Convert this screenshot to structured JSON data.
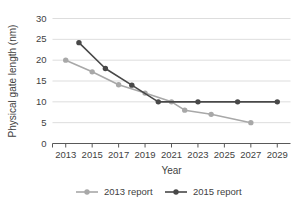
{
  "chart_data": {
    "type": "line",
    "title": "",
    "xlabel": "Year",
    "ylabel": "Physical gate length (nm)",
    "xlim": [
      2012,
      2030
    ],
    "ylim": [
      0,
      30
    ],
    "yticks": [
      0,
      5,
      10,
      15,
      20,
      25,
      30
    ],
    "ytick_labels": [
      "0",
      "5",
      "10",
      "15",
      "20",
      "25",
      "30"
    ],
    "xticks": [
      2013,
      2015,
      2017,
      2019,
      2021,
      2023,
      2025,
      2027,
      2029
    ],
    "xtick_labels": [
      "2013",
      "2015",
      "2017",
      "2019",
      "2021",
      "2023",
      "2025",
      "2027",
      "2029"
    ],
    "grid": "horizontal",
    "legend_position": "bottom",
    "series": [
      {
        "name": "2013 report",
        "color": "#a8a8a8",
        "marker": "circle",
        "x": [
          2013,
          2015,
          2017,
          2019,
          2021,
          2022,
          2024,
          2027
        ],
        "values": [
          20.0,
          17.2,
          14.1,
          12.1,
          10.0,
          8.0,
          7.0,
          5.0
        ]
      },
      {
        "name": "2015 report",
        "color": "#484848",
        "marker": "circle",
        "x": [
          2014,
          2016,
          2018,
          2020,
          2023,
          2026,
          2029
        ],
        "values": [
          24.2,
          18.0,
          14.0,
          10.0,
          10.0,
          10.0,
          10.0
        ]
      }
    ]
  },
  "legend": {
    "entries": [
      {
        "label": "2013 report",
        "color": "#a8a8a8"
      },
      {
        "label": "2015 report",
        "color": "#484848"
      }
    ]
  },
  "axes": {
    "x_title": "Year",
    "y_title": "Physical gate length (nm)"
  }
}
